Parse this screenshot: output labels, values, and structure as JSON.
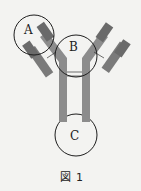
{
  "figure": {
    "caption_symbol": "図",
    "caption_number": "1",
    "labels": {
      "a": "A",
      "b": "B",
      "c": "C"
    },
    "colors": {
      "background": "#f3f3f1",
      "dark_chain": "#6f6f6f",
      "light_chain": "#8a8a8a",
      "circle_stroke": "#1e1e1e"
    }
  }
}
